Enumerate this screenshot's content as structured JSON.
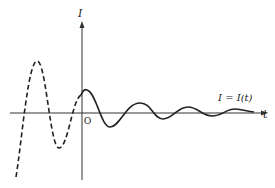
{
  "diagram": {
    "type": "damped-oscillation-graph",
    "axes": {
      "vertical_label": "I",
      "horizontal_label": "t",
      "origin_label": "O"
    },
    "curve_label": "I = I(t)",
    "curves": [
      {
        "name": "past-oscillation",
        "style": "dashed",
        "description": "extrapolated oscillation for t < 0, growing amplitude backward"
      },
      {
        "name": "damped-oscillation",
        "style": "solid",
        "description": "decaying oscillation for t >= 0"
      }
    ],
    "colors": {
      "line": "#222222",
      "axis": "#333333",
      "background": "#ffffff"
    }
  }
}
